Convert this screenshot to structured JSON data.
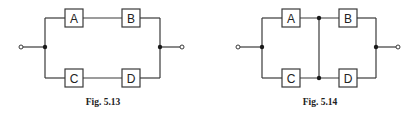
{
  "figures": [
    {
      "id": "fig-5-13",
      "caption": "Fig. 5.13",
      "blocks": [
        "A",
        "B",
        "C",
        "D"
      ],
      "description": "Two series branches (A-B and C-D) in parallel"
    },
    {
      "id": "fig-5-14",
      "caption": "Fig. 5.14",
      "blocks": [
        "A",
        "B",
        "C",
        "D"
      ],
      "description": "A parallel C, in series with B parallel D (cross-connected midpoint)"
    }
  ]
}
